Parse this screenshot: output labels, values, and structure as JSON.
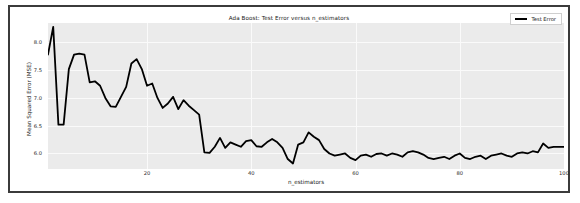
{
  "figure": {
    "title": "Ada Boost: Test Error versus n_estimators",
    "frame_color": "#3b3b3b",
    "face_color": "#ffffff",
    "axes_bg_color": "#ebebeb",
    "grid_color": "#fafafa"
  },
  "legend": {
    "position": "upper-right",
    "entries": [
      {
        "label": "Test Error",
        "color": "#000000"
      }
    ]
  },
  "chart_data": {
    "type": "line",
    "title": "Ada Boost: Test Error versus n_estimators",
    "xlabel": "n_estimators",
    "ylabel": "Mean Squared Error (MSE)",
    "xlim": [
      1,
      100
    ],
    "ylim": [
      5.72,
      8.35
    ],
    "xticks": [
      20,
      40,
      60,
      80,
      100
    ],
    "xticklabels": [
      "20",
      "40",
      "60",
      "80",
      "100"
    ],
    "yticks": [
      6.0,
      6.5,
      7.0,
      7.5,
      8.0
    ],
    "yticklabels": [
      "6.0",
      "6.5",
      "7.0",
      "7.5",
      "8.0"
    ],
    "grid": true,
    "legend_position": "upper right",
    "series": [
      {
        "name": "Test Error",
        "color": "#000000",
        "linewidth": 1.8,
        "x": [
          1,
          2,
          3,
          4,
          5,
          6,
          7,
          8,
          9,
          10,
          11,
          12,
          13,
          14,
          15,
          16,
          17,
          18,
          19,
          20,
          21,
          22,
          23,
          24,
          25,
          26,
          27,
          28,
          29,
          30,
          31,
          32,
          33,
          34,
          35,
          36,
          37,
          38,
          39,
          40,
          41,
          42,
          43,
          44,
          45,
          46,
          47,
          48,
          49,
          50,
          51,
          52,
          53,
          54,
          55,
          56,
          57,
          58,
          59,
          60,
          61,
          62,
          63,
          64,
          65,
          66,
          67,
          68,
          69,
          70,
          71,
          72,
          73,
          74,
          75,
          76,
          77,
          78,
          79,
          80,
          81,
          82,
          83,
          84,
          85,
          86,
          87,
          88,
          89,
          90,
          91,
          92,
          93,
          94,
          95,
          96,
          97,
          98,
          99,
          100
        ],
        "y": [
          7.78,
          8.28,
          6.52,
          6.52,
          7.52,
          7.78,
          7.8,
          7.78,
          7.28,
          7.3,
          7.22,
          7.0,
          6.85,
          6.84,
          7.02,
          7.2,
          7.62,
          7.7,
          7.52,
          7.22,
          7.26,
          7.0,
          6.82,
          6.9,
          7.02,
          6.8,
          6.96,
          6.86,
          6.78,
          6.7,
          6.02,
          6.01,
          6.12,
          6.28,
          6.1,
          6.2,
          6.16,
          6.12,
          6.22,
          6.24,
          6.13,
          6.12,
          6.2,
          6.26,
          6.2,
          6.1,
          5.9,
          5.82,
          6.16,
          6.2,
          6.38,
          6.3,
          6.24,
          6.08,
          6.0,
          5.96,
          5.98,
          6.0,
          5.92,
          5.88,
          5.96,
          5.98,
          5.94,
          5.99,
          6.0,
          5.96,
          6.0,
          5.98,
          5.94,
          6.02,
          6.04,
          6.02,
          5.98,
          5.92,
          5.9,
          5.92,
          5.94,
          5.9,
          5.96,
          6.0,
          5.92,
          5.9,
          5.94,
          5.96,
          5.9,
          5.96,
          5.98,
          6.0,
          5.96,
          5.94,
          6.0,
          6.02,
          6.0,
          6.04,
          6.02,
          6.18,
          6.1,
          6.12,
          6.12,
          6.12
        ]
      }
    ]
  }
}
